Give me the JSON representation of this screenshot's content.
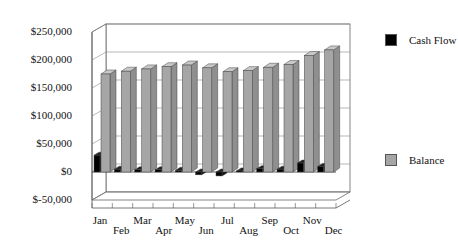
{
  "chart_data": {
    "type": "bar",
    "style": "3d-column",
    "title": "",
    "xlabel": "",
    "ylabel": "",
    "categories": [
      "Jan",
      "Feb",
      "Mar",
      "Apr",
      "May",
      "Jun",
      "Jul",
      "Aug",
      "Sep",
      "Oct",
      "Nov",
      "Dec"
    ],
    "series": [
      {
        "name": "Cash Flow",
        "color": "#000000",
        "values": [
          30000,
          5000,
          4000,
          4000,
          3000,
          -5000,
          -7000,
          2000,
          6000,
          5000,
          16000,
          10000
        ]
      },
      {
        "name": "Balance",
        "color": "#a6a6a6",
        "values": [
          175000,
          180000,
          184000,
          188000,
          191000,
          186000,
          179000,
          181000,
          187000,
          192000,
          208000,
          218000
        ]
      }
    ],
    "yticks": [
      "$250,000",
      "$200,000",
      "$150,000",
      "$100,000",
      "$50,000",
      "$0",
      "$-50,000"
    ],
    "ytick_values": [
      250000,
      200000,
      150000,
      100000,
      50000,
      0,
      -50000
    ],
    "ylim": [
      -50000,
      250000
    ],
    "grid": true,
    "legend_position": "right"
  }
}
